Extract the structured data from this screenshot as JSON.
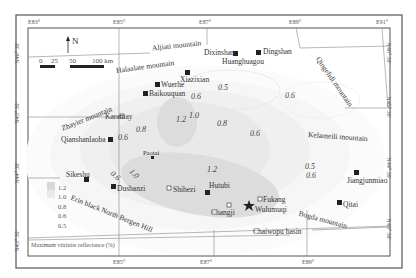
{
  "map": {
    "title": "Maximum vitrinite reflectance (%)",
    "north_label": "N",
    "scale_bar": {
      "labels": [
        "0",
        "25",
        "50",
        "100 km"
      ]
    },
    "longitude_ticks": [
      "E83°",
      "E85°",
      "E87°",
      "E89°",
      "E91°"
    ],
    "latitude_ticks_left": [
      "N46° 30'",
      "N45° 30'",
      "N44° 30'",
      "N43° 30'"
    ],
    "latitude_ticks_right": [
      "N46° 30'",
      "N45° 30'",
      "N44° 30'",
      "N43° 30'"
    ],
    "legend": {
      "title": "Maximum vitrinite reflectance (%)",
      "items": [
        "1.2",
        "1.0",
        "0.8",
        "0.6",
        "0.5"
      ],
      "colors": [
        "#d9d9d9",
        "#e6e6e6",
        "#f0f0f0",
        "#f6f6f6",
        "#fbfbfb"
      ]
    },
    "mountains": [
      "Aljiati mountain",
      "Halaalate mountain",
      "Qingelidi mountain",
      "Zhayier mountain",
      "Kelameili mountain",
      "Erin black North Bergen Hill",
      "Bogda mountain"
    ],
    "basins": [
      "Chaiwopu basin"
    ],
    "cities_filled": [
      "Dixinshan",
      "Huanghuagou",
      "Dingshan",
      "Xiazixian",
      "Wuerhe",
      "Baikouquan",
      "Qianshanlaoba",
      "Paotai",
      "Sikeshu",
      "Dushanzi",
      "Hutubi",
      "Jiangjunmiao",
      "Qitai"
    ],
    "cities_open": [
      "Karamay",
      "Shihezi",
      "Changji",
      "Fukang"
    ],
    "capital": "Wulumuqi",
    "contour_values": [
      "1.2",
      "1.0",
      "0.8",
      "0.6",
      "0.5",
      "0.6",
      "0.8",
      "0.6",
      "1.0",
      "0.6",
      "1.2",
      "0.5",
      "0.6",
      "0.6",
      "0.6"
    ]
  }
}
